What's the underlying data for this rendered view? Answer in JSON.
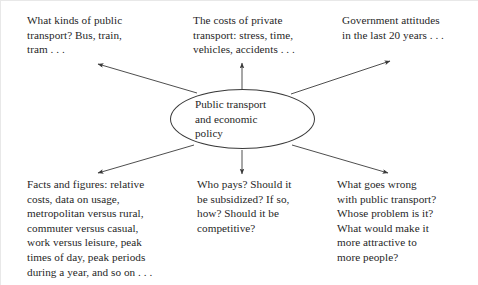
{
  "diagram": {
    "type": "spider-diagram",
    "center": {
      "label": "Public transport\nand economic\npolicy",
      "shape": "ellipse"
    },
    "branches": [
      {
        "id": "top-left",
        "label": "What kinds of public\ntransport? Bus, train,\ntram . . ."
      },
      {
        "id": "top-center",
        "label": "The costs of private\ntransport: stress, time,\nvehicles, accidents . . ."
      },
      {
        "id": "top-right",
        "label": "Government attitudes\nin the last 20 years . . ."
      },
      {
        "id": "bottom-left",
        "label": "Facts and figures: relative\ncosts, data on usage,\nmetropolitan versus rural,\ncommuter versus casual,\nwork versus leisure, peak\ntimes of day, peak periods\nduring a year, and so on . . ."
      },
      {
        "id": "bottom-center",
        "label": "Who pays? Should it\nbe subsidized? If so,\nhow? Should it be\ncompetitive?"
      },
      {
        "id": "bottom-right",
        "label": "What goes wrong\nwith public transport?\nWhose problem is it?\nWhat would make it\nmore attractive to\nmore people?"
      }
    ],
    "colors": {
      "stroke": "#3a3a3a",
      "text": "#1f1f1f",
      "background": "#ffffff"
    }
  }
}
